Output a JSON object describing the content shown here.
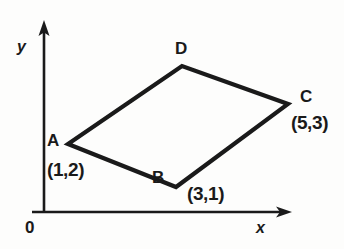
{
  "figure": {
    "type": "coordinate-geometry-diagram",
    "background_color": "#fdfdfc",
    "stroke_color": "#1a1a1a",
    "axes": {
      "origin_label": "0",
      "x_axis_label": "x",
      "y_axis_label": "y",
      "x_axis_y_px": 212,
      "y_axis_x_px": 44,
      "x_axis_end_px": 290,
      "y_axis_top_px": 22
    },
    "shape": {
      "name": "parallelogram",
      "stroke_width_px": 4,
      "vertices": [
        {
          "letter": "A",
          "coord_text": "(1,2)",
          "x": 1,
          "y": 2,
          "px": 68,
          "py": 144
        },
        {
          "letter": "B",
          "coord_text": "(3,1)",
          "x": 3,
          "y": 1,
          "px": 176,
          "py": 187
        },
        {
          "letter": "C",
          "coord_text": "(5,3)",
          "x": 5,
          "y": 3,
          "px": 288,
          "py": 104
        },
        {
          "letter": "D",
          "coord_text": "",
          "x": 3,
          "y": 4,
          "px": 182,
          "py": 66
        }
      ]
    },
    "labels": {
      "a_letter": "A",
      "a_coord": "(1,2)",
      "b_letter": "B",
      "b_coord": "(3,1)",
      "c_letter": "C",
      "c_coord": "(5,3)",
      "d_letter": "D",
      "origin": "0",
      "x_axis": "x",
      "y_axis": "y"
    }
  }
}
